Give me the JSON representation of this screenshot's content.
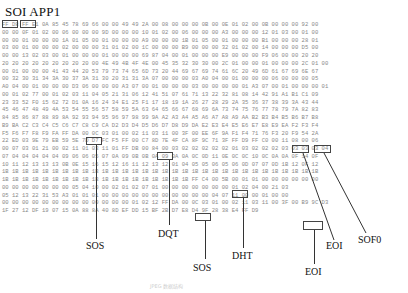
{
  "header": {
    "title": "SOI APP1"
  },
  "hex_rows": [
    "FF D8 FF E1 0A 85 45 78 69 66 00 00 49 49 2A 00 08 00 00 00 0B 00 0E 01 02 00 0B 00 00 00 92 00",
    "00 00 0F 01 02 00 06 00 00 00 9D 00 00 00 10 01 02 00 06 00 00 00 A3 00 00 00 12 01 03 00 01 00",
    "00 00 01 00 00 00 1A 01 05 00 01 00 00 00 A9 00 00 00 1B 01 05 00 01 00 00 00 B1 00 00 00 28 01",
    "03 00 01 00 00 00 02 00 00 00 31 01 02 00 1C 00 00 00 B9 00 00 00 32 01 02 00 14 00 00 00 D5 00",
    "00 00 13 02 03 00 01 00 00 00 01 00 00 00 69 87 04 00 01 00 00 00 E9 00 00 00 F9 06 00 00 20 20",
    "20 20 20 20 20 20 20 20 20 00 4E 49 4B 4F 4E 00 45 35 32 30 30 00 2C 01 00 00 01 00 00 00 2C 01 00",
    "00 01 00 00 00 41 43 44 20 53 79 73 74 65 6D 73 20 44 69 67 69 74 61 6C 20 49 6D 61 67 69 6E 67",
    "00 32 30 31 34 3A 30 37 3A 31 30 20 31 31 3A 07 00 00 00 03 A0 04 00 01 00 00 00 06 00 00 00 05",
    "A0 04 00 01 00 00 00 D3 06 00 00 00 A3 07 00 01 00 00 00 03 00 00 00 00 01 A3 07 00 01 00 00 00 01",
    "00 01 02 77 00 01 02 03 11 04 05 21 31 06 12 41 51 07 61 71 13 22 32 81 08 14 42 91 A1 B1 C1 09",
    "23 33 52 F0 15 62 72 D1 0A 16 24 34 E1 25 F1 17 18 19 1A 26 27 28 29 2A 35 36 37 38 39 3A 43 44",
    "45 46 47 48 49 4A 53 54 55 56 57 58 59 5A 63 64 65 66 67 68 69 6A 73 74 75 76 77 78 79 7A 82 83",
    "84 85 86 87 88 89 8A 92 93 94 95 96 97 98 99 9A A2 A3 A4 A5 A6 A7 A8 A9 AA B2 B3 B4 B5 B6 B7 B8",
    "B9 BA C2 C3 C4 C5 C6 C7 C8 C9 CA D2 D3 D4 D5 D6 D7 D8 D9 DA E2 E3 E4 E5 E6 E7 E8 E9 EA F2 F3 F4",
    "F5 F6 F7 F8 F9 FA FF DA 00 0C 03 01 00 02 11 03 11 00 3F 00 EE 6F 9A F1 F4 71 76 F3 20 F9 54 2A",
    "22 ED 03 9E 79 EB 59 5E 7D D7 FC F5 FF 00 C7 8D 7E 4F CA 8F 9C 71 3F FF D9 FF C0 00 11 08 00 06",
    "00 07 03 01 21 00 02 11 01 03 11 01 FF DB 00 84 00 03 02 02 02 02 02 01 03 02 02 02 03 03 03 03 04",
    "07 04 04 04 04 04 09 06 06 05 07 0A 09 0B 0B 0A 09 0A 0A 0C 0D 11 0E 0C 0C 10 0C 0A 0A 0F 14 0F",
    "10 11 12 13 13 13 0B 0E 15 16 15 12 16 11 12 13 12 01 04 05 05 06 05 06 0D 07 07 0D 1B 12 0F 12",
    "1B 1B 1B 1B 1B 1B 1B 1B 1B 1B 1B 1B 1B 1B 1B 1B 1B 1B 1B 1B 1B 1B 1B 1B 1B 1B 1B 1B 1B 1B 1B 1B",
    "1B 1B 1B 1B 1B 1B 1B 1B 1B 1B 1B 1B 1B 1B 1B 1B 1B 1B 1B FF C4 00 5B 00 01 01 00 00 00 00 00 00",
    "00 00 00 00 00 00 00 05 04 10 00 02 01 02 07 01 00 00 00 00 00 00 00 01 02 04 00 21 03",
    "05 12 13 22 31 53 A3 01 01 01 00 00 00 00 00 00 00 00 00 00 00 04 07 11 00 00 01 00 00",
    "00 00 00 00 00 00 00 00 00 00 00 00 00 01 02 12 FF DA 00 0C 03 01 00 02 11 03 11 00 3F 00 B9 9C D3",
    "1F 27 12 DF 19 07 15 0A 88 8A 40 8D EF DD 15 BF 2B D7 E8 D4 9F 28 38 E4 FF D9"
  ],
  "annotations": [
    {
      "id": "soi",
      "label": "SOI"
    },
    {
      "id": "app1",
      "label": "APP1"
    },
    {
      "id": "sos1",
      "label": "SOS"
    },
    {
      "id": "dqt",
      "label": "DQT"
    },
    {
      "id": "sos2",
      "label": "SOS"
    },
    {
      "id": "dht",
      "label": "DHT"
    },
    {
      "id": "eoi1",
      "label": "EOI"
    },
    {
      "id": "eoi2",
      "label": "EOI"
    },
    {
      "id": "sof0",
      "label": "SOF0"
    }
  ],
  "caption": "JPEG 数据结构"
}
